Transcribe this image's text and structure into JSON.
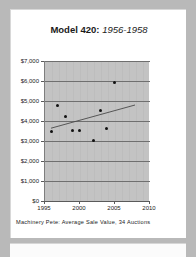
{
  "chart_data": {
    "type": "scatter",
    "title_main": "Model 420:",
    "title_sub": "1956-1958",
    "title": "Model 420: 1956-1958",
    "caption": "Machinery Pete: Average Sale Value, 34 Auctions",
    "xlabel": "",
    "ylabel": "",
    "xlim": [
      1995,
      2010
    ],
    "ylim": [
      0,
      7000
    ],
    "grid": true,
    "legend": "none",
    "x_ticks": [
      "1995",
      "2000",
      "2005",
      "2010"
    ],
    "x_tick_values": [
      1995,
      2000,
      2005,
      2010
    ],
    "y_ticks": [
      "$0",
      "$1,000",
      "$2,000",
      "$3,000",
      "$4,000",
      "$5,000",
      "$6,000",
      "$7,000"
    ],
    "y_tick_values": [
      0,
      1000,
      2000,
      3000,
      4000,
      5000,
      6000,
      7000
    ],
    "points": [
      {
        "x": 1996.1,
        "y": 3500
      },
      {
        "x": 1996.9,
        "y": 4760
      },
      {
        "x": 1998.0,
        "y": 4240
      },
      {
        "x": 1999.1,
        "y": 3550
      },
      {
        "x": 2000.1,
        "y": 3550
      },
      {
        "x": 2002.0,
        "y": 3030
      },
      {
        "x": 2003.1,
        "y": 4520
      },
      {
        "x": 2003.9,
        "y": 3650
      },
      {
        "x": 2005.0,
        "y": 5950
      }
    ],
    "trendline": {
      "name": "linear trend",
      "x0": 1996.0,
      "y0": 3640,
      "x1": 2008.0,
      "y1": 4800
    },
    "series": [
      {
        "name": "Average Sale Value",
        "x": [
          1996.1,
          1996.9,
          1998.0,
          1999.1,
          2000.1,
          2002.0,
          2003.1,
          2003.9,
          2005.0
        ],
        "values": [
          3500,
          4760,
          4240,
          3550,
          3550,
          3030,
          4520,
          3650,
          5950
        ]
      }
    ],
    "colors": {
      "plot_background": "#c3c3c3",
      "gridline": "#6f6f6f",
      "marker": "#111111",
      "trendline": "#4a4a4a",
      "page_background": "#b9b9b9",
      "card_background": "#ffffff"
    }
  }
}
